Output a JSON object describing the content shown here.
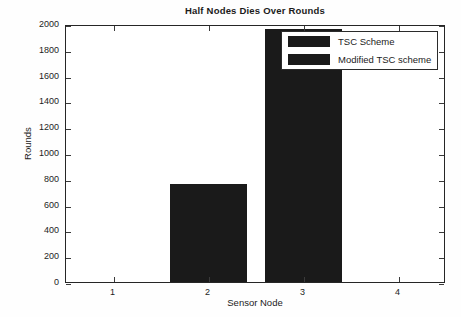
{
  "chart_data": {
    "type": "bar",
    "title": "Half Nodes Dies Over Rounds",
    "xlabel": "Sensor Node",
    "ylabel": "Rounds",
    "categories": [
      "1",
      "2",
      "3",
      "4"
    ],
    "x": [
      1,
      2,
      3,
      4
    ],
    "values": [
      0,
      760,
      1965,
      0
    ],
    "series": [
      {
        "name": "TSC Scheme",
        "values": [
          0,
          760,
          1965,
          0
        ]
      }
    ],
    "legend": {
      "position": "upper right",
      "entries": [
        "TSC Scheme",
        "Modified TSC scheme"
      ]
    },
    "xlim": [
      0.5,
      4.5
    ],
    "ylim": [
      0,
      2000
    ],
    "yticks": [
      0,
      200,
      400,
      600,
      800,
      1000,
      1200,
      1400,
      1600,
      1800,
      2000
    ],
    "ytick_labels": [
      "0",
      "200",
      "400",
      "600",
      "800",
      "1000",
      "1200",
      "1400",
      "1600",
      "1800",
      "2000"
    ],
    "xticks": [
      1,
      2,
      3,
      4
    ],
    "xtick_labels": [
      "1",
      "2",
      "3",
      "4"
    ],
    "grid": false,
    "bar_color": "#1a1a1a",
    "axis_color": "#262626",
    "background_color": "#ffffff"
  }
}
